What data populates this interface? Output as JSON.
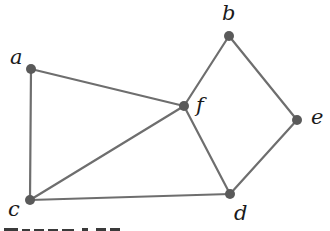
{
  "diagram": {
    "type": "undirected-graph",
    "colors": {
      "edge": "#6e6e6e",
      "node": "#5a5a5a",
      "label": "#1a1a1a",
      "background": "#ffffff"
    },
    "nodes": [
      {
        "id": "a",
        "label": "a",
        "x": 31,
        "y": 69,
        "lx": 10,
        "ly": 64
      },
      {
        "id": "b",
        "label": "b",
        "x": 229,
        "y": 36,
        "lx": 222,
        "ly": 20
      },
      {
        "id": "c",
        "label": "c",
        "x": 30,
        "y": 200,
        "lx": 8,
        "ly": 216
      },
      {
        "id": "d",
        "label": "d",
        "x": 230,
        "y": 194,
        "lx": 234,
        "ly": 220
      },
      {
        "id": "e",
        "label": "e",
        "x": 297,
        "y": 120,
        "lx": 311,
        "ly": 124
      },
      {
        "id": "f",
        "label": "f",
        "x": 184,
        "y": 106,
        "lx": 196,
        "ly": 112
      }
    ],
    "edges": [
      [
        "a",
        "c"
      ],
      [
        "a",
        "f"
      ],
      [
        "c",
        "f"
      ],
      [
        "c",
        "d"
      ],
      [
        "f",
        "b"
      ],
      [
        "f",
        "d"
      ],
      [
        "b",
        "e"
      ],
      [
        "e",
        "d"
      ]
    ]
  }
}
